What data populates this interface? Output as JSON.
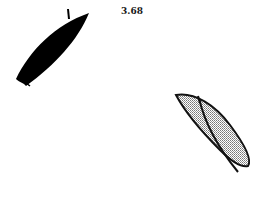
{
  "figure": {
    "label": "3.68",
    "shapes": [
      {
        "name": "solid-leaf",
        "fill": "#000000"
      },
      {
        "name": "stippled-leaf-pair",
        "fill": "#bdbdbd",
        "stroke": "#111111"
      }
    ]
  }
}
